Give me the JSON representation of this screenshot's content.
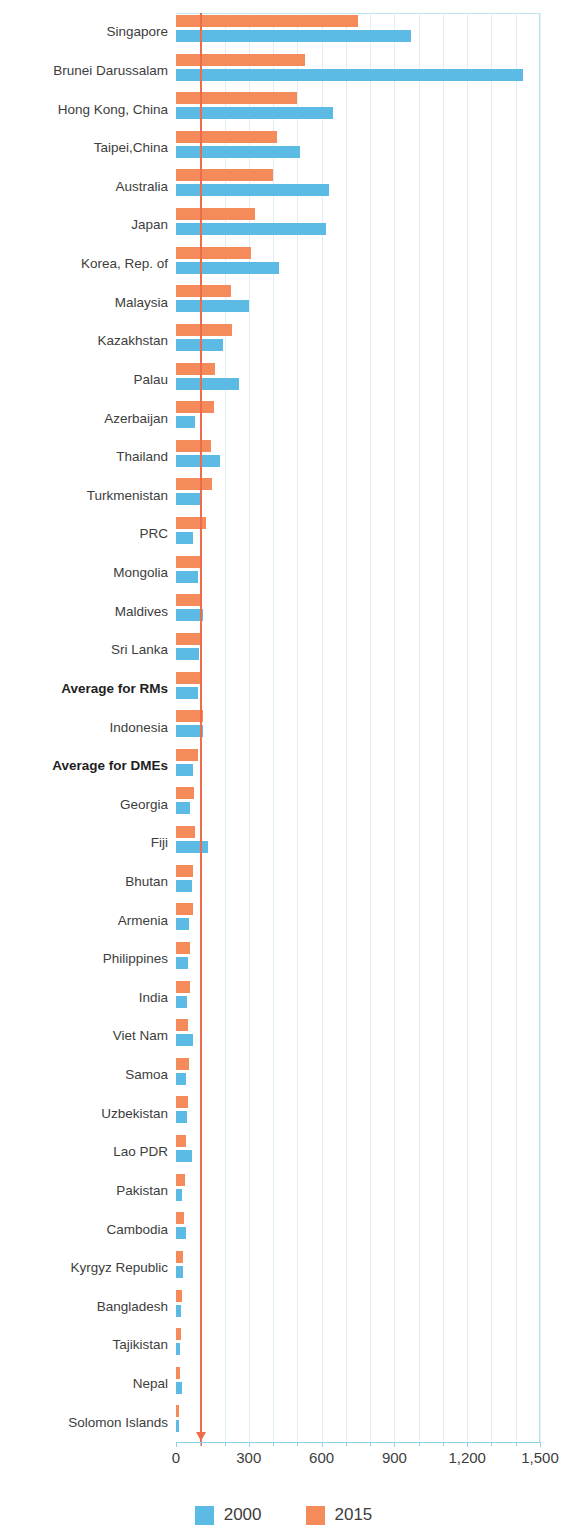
{
  "chart_data": {
    "type": "bar",
    "orientation": "horizontal",
    "title": "",
    "subtitle": "",
    "xlabel": "",
    "ylabel": "",
    "xlim": [
      0,
      1500
    ],
    "xticks": [
      0,
      300,
      600,
      900,
      1200,
      1500
    ],
    "xtick_labels": [
      "0",
      "300",
      "600",
      "900",
      "1,200",
      "1,500"
    ],
    "minor_tick_step": 100,
    "grid": true,
    "grid_axis": "x",
    "legend_position": "bottom-center",
    "categories": [
      "Singapore",
      "Brunei Darussalam",
      "Hong Kong, China",
      "Taipei,China",
      "Australia",
      "Japan",
      "Korea, Rep. of",
      "Malaysia",
      "Kazakhstan",
      "Palau",
      "Azerbaijan",
      "Thailand",
      "Turkmenistan",
      "PRC",
      "Mongolia",
      "Maldives",
      "Sri Lanka",
      "Average for RMs",
      "Indonesia",
      "Average for DMEs",
      "Georgia",
      "Fiji",
      "Bhutan",
      "Armenia",
      "Philippines",
      "India",
      "Viet Nam",
      "Samoa",
      "Uzbekistan",
      "Lao PDR",
      "Pakistan",
      "Cambodia",
      "Kyrgyz Republic",
      "Bangladesh",
      "Tajikistan",
      "Nepal",
      "Solomon Islands"
    ],
    "bold_categories": [
      "Average for RMs",
      "Average for DMEs"
    ],
    "series": [
      {
        "name": "2000",
        "color": "#5bbbe4",
        "values": [
          968,
          1430,
          646,
          510,
          630,
          618,
          425,
          302,
          193,
          260,
          78,
          181,
          102,
          70,
          90,
          113,
          95,
          91,
          113,
          72,
          58,
          133,
          65,
          55,
          51,
          44,
          72,
          42,
          44,
          65,
          25,
          42,
          30,
          22,
          16,
          24,
          14
        ]
      },
      {
        "name": "2015",
        "color": "#f58a5a",
        "values": [
          750,
          531,
          498,
          415,
          400,
          326,
          309,
          226,
          230,
          161,
          157,
          143,
          147,
          124,
          106,
          106,
          102,
          103,
          111,
          90,
          76,
          78,
          72,
          69,
          58,
          58,
          51,
          55,
          51,
          42,
          38,
          34,
          30,
          26,
          20,
          17,
          12
        ]
      }
    ],
    "reference_line": {
      "value": 100,
      "color": "#ef6c4a",
      "has_arrowhead": true
    }
  },
  "legend": {
    "entries": [
      {
        "label": "2000",
        "color": "#5bbbe4"
      },
      {
        "label": "2015",
        "color": "#f58a5a"
      }
    ]
  }
}
